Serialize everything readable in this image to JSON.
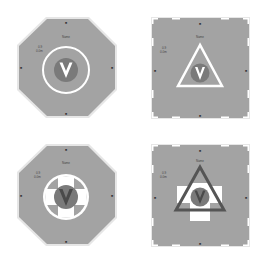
{
  "colors": {
    "background": "#ffffff",
    "pad_fill": "#a3a3a3",
    "pad_border": "#e6e6e6",
    "marking_white": "#ffffff",
    "v_circle": "#7a7a7a",
    "v_glyph": "#ffffff",
    "triangle_dark": "#555555"
  },
  "panels": [
    {
      "id": "top-left",
      "shape": "octagon",
      "symbol": "circle",
      "name_label": "Name",
      "info_line1": "0.9",
      "info_line2": "0.0m",
      "center_glyph": "V",
      "edge_marks": [
        "N",
        "E",
        "S",
        "W"
      ]
    },
    {
      "id": "top-right",
      "shape": "square",
      "symbol": "triangle",
      "name_label": "Name",
      "info_line1": "0.9",
      "info_line2": "0.0m",
      "center_glyph": "V",
      "edge_marks": [
        "N",
        "E",
        "S",
        "W"
      ]
    },
    {
      "id": "bottom-left",
      "shape": "octagon",
      "symbol": "circle-with-cross",
      "name_label": "Name",
      "info_line1": "0.9",
      "info_line2": "0.0m",
      "center_glyph": "V",
      "edge_marks": [
        "N",
        "E",
        "S",
        "W"
      ]
    },
    {
      "id": "bottom-right",
      "shape": "square",
      "symbol": "triangle-with-cross",
      "name_label": "Name",
      "info_line1": "0.9",
      "info_line2": "0.0m",
      "center_glyph": "V",
      "edge_marks": [
        "N",
        "E",
        "S",
        "W"
      ]
    }
  ]
}
